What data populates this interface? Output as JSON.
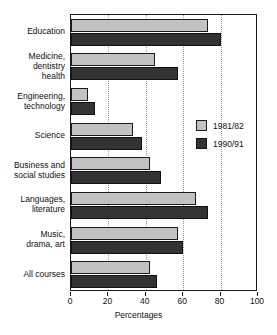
{
  "chart_data": {
    "type": "bar",
    "orientation": "horizontal",
    "title": "",
    "xlabel": "Percentages",
    "ylabel": "",
    "xlim": [
      0,
      100
    ],
    "xticks": [
      0,
      20,
      40,
      60,
      80,
      100
    ],
    "grid": "vertical-dotted",
    "legend_position": "inside-right",
    "categories": [
      "Education",
      "Medicine,\ndentistry\nhealth",
      "Engineering,\ntechnology",
      "Science",
      "Business and\nsocial studies",
      "Languages,\nliterature",
      "Music,\ndrama, art",
      "All courses"
    ],
    "series": [
      {
        "name": "1981/82",
        "color": "#c2c2c2",
        "values": [
          73,
          45,
          9,
          33,
          42,
          67,
          57,
          42
        ]
      },
      {
        "name": "1990/91",
        "color": "#333333",
        "values": [
          80,
          57,
          13,
          38,
          48,
          73,
          60,
          46
        ]
      }
    ]
  }
}
